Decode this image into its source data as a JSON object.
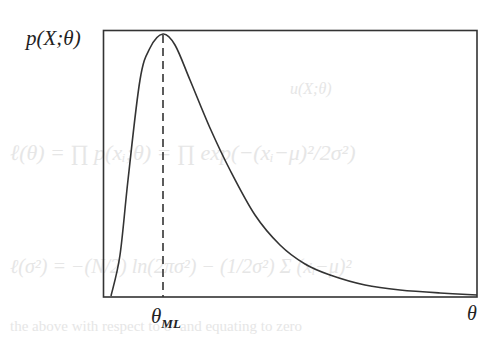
{
  "chart_data": {
    "type": "line",
    "title": "",
    "ylabel": "p(X;θ)",
    "xlabel": "θ",
    "annotations": [
      {
        "type": "vertical-dashed-line",
        "label": "θ_ML",
        "label_main": "θ",
        "label_sub": "ML",
        "at": "mode of curve"
      }
    ],
    "grid": false,
    "legend": null,
    "axis_ticks": "none",
    "series": [
      {
        "name": "likelihood",
        "description": "right-skewed unimodal curve, peak at θ_ML",
        "x_px": [
          111,
          120,
          128,
          140,
          150,
          163,
          175,
          190,
          210,
          230,
          255,
          280,
          305,
          330,
          365,
          400,
          440,
          477
        ],
        "y_px": [
          296,
          255,
          180,
          80,
          48,
          34,
          45,
          80,
          128,
          170,
          215,
          245,
          264,
          275,
          285,
          290,
          293,
          295
        ]
      }
    ],
    "frame_px": {
      "left": 103,
      "top": 30,
      "right": 477,
      "bottom": 297
    },
    "mode_x_px": 163
  },
  "labels": {
    "y_axis": "p(X;θ)",
    "x_axis": "θ",
    "theta_ml_main": "θ",
    "theta_ml_sub": "ML"
  }
}
